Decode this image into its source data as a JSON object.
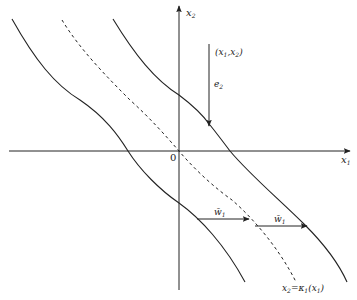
{
  "diagram": {
    "type": "phase-plane",
    "axes": {
      "x": {
        "label": "x",
        "sub": "1"
      },
      "y": {
        "label": "x",
        "sub": "2"
      },
      "origin_label": "0"
    },
    "point": {
      "label": "(x",
      "sub1": "1",
      "mid": ",x",
      "sub2": "2",
      "close": ")"
    },
    "vector_e": {
      "label": "e",
      "sub": "2"
    },
    "vector_w_left": {
      "label": "w̄",
      "sub": "1"
    },
    "vector_w_right": {
      "label": "w̄",
      "sub": "1"
    },
    "manifold": {
      "label_lhs": "x",
      "lhs_sub": "2",
      "eq": "=",
      "kappa": "κ",
      "kappa_sub": "1",
      "arg_open": "(x",
      "arg_sub": "1",
      "arg_close": ")"
    },
    "curves": [
      {
        "name": "left-boundary-curve",
        "style": "solid"
      },
      {
        "name": "manifold-curve",
        "style": "dashed"
      },
      {
        "name": "right-boundary-curve",
        "style": "solid"
      }
    ],
    "colors": {
      "stroke": "#222222",
      "background": "#ffffff"
    }
  }
}
